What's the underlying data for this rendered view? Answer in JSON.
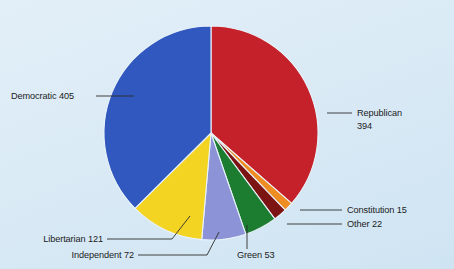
{
  "chart_data": {
    "type": "pie",
    "title": "",
    "subtitle": "",
    "xlabel": "",
    "ylabel": "",
    "legend_position": "callout-labels",
    "grid": false,
    "total": 1082,
    "start_angle_deg": 0,
    "direction": "clockwise",
    "categories": [
      "Republican",
      "Constitution",
      "Other",
      "Green",
      "Independent",
      "Libertarian",
      "Democratic"
    ],
    "values": [
      394,
      15,
      22,
      53,
      72,
      121,
      405
    ],
    "colors": [
      "#c4212a",
      "#ef8c22",
      "#7d1414",
      "#1c7c30",
      "#8c93d6",
      "#f4d423",
      "#3058be"
    ],
    "slices": [
      {
        "name": "Republican",
        "label": "Republican",
        "value_label": "394",
        "value": 394,
        "color": "#c4212a",
        "percent": 36.4
      },
      {
        "name": "Constitution",
        "label": "Constitution 15",
        "value_label": "15",
        "value": 15,
        "color": "#ef8c22",
        "percent": 1.4
      },
      {
        "name": "Other",
        "label": "Other 22",
        "value_label": "22",
        "value": 22,
        "color": "#7d1414",
        "percent": 2.0
      },
      {
        "name": "Green",
        "label": "Green 53",
        "value_label": "53",
        "value": 53,
        "color": "#1c7c30",
        "percent": 4.9
      },
      {
        "name": "Independent",
        "label": "Independent 72",
        "value_label": "72",
        "value": 72,
        "color": "#8c93d6",
        "percent": 6.7
      },
      {
        "name": "Libertarian",
        "label": "Libertarian 121",
        "value_label": "121",
        "value": 121,
        "color": "#f4d423",
        "percent": 11.2
      },
      {
        "name": "Democratic",
        "label": "Democratic 405",
        "value_label": "405",
        "value": 405,
        "color": "#3058be",
        "percent": 37.4
      }
    ]
  },
  "labels": {
    "democratic": "Democratic 405",
    "republican_name": "Republican",
    "republican_value": "394",
    "libertarian": "Libertarian 121",
    "independent": "Independent 72",
    "green": "Green 53",
    "constitution": "Constitution 15",
    "other": "Other 22"
  },
  "style": {
    "background": "#dcebf6",
    "text_color": "#1b1b1b",
    "leader_color": "#2c2c2c",
    "slice_separator": "#e9f3fa"
  }
}
